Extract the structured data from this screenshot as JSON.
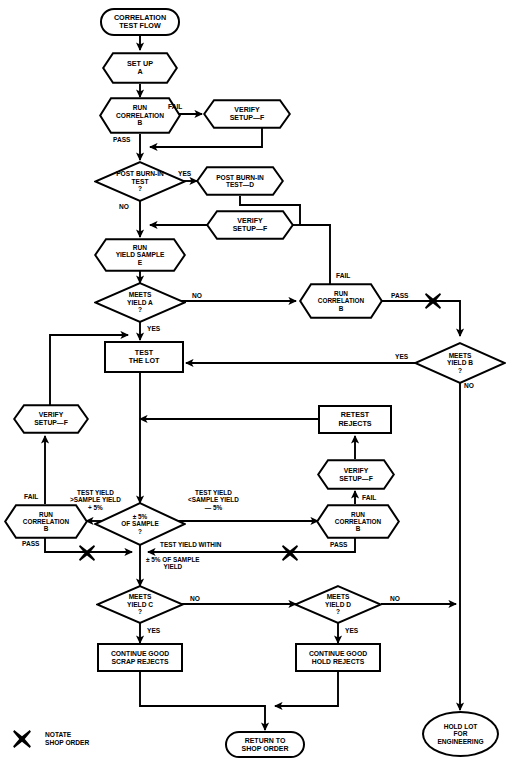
{
  "diagram": {
    "title": "CORRELATION TEST FLOW",
    "type": "flowchart"
  },
  "nodes": {
    "start": {
      "label": "CORRELATION\nTEST FLOW",
      "shape": "stadium"
    },
    "setup_a": {
      "label": "SET UP\nA",
      "shape": "hexagon"
    },
    "run_corr_b_1": {
      "label": "RUN\nCORRELATION\nB",
      "shape": "hexagon"
    },
    "verify_setup_f_1": {
      "label": "VERIFY\nSETUP—F",
      "shape": "hexagon"
    },
    "post_burn_in_test": {
      "label": "POST BURN-IN\nTEST\n?",
      "shape": "diamond"
    },
    "post_burn_in_test_d": {
      "label": "POST BURN-IN\nTEST—D",
      "shape": "hexagon"
    },
    "verify_setup_f_2": {
      "label": "VERIFY\nSETUP—F",
      "shape": "hexagon"
    },
    "run_yield_sample_e": {
      "label": "RUN\nYIELD SAMPLE\nE",
      "shape": "hexagon"
    },
    "meets_yield_a": {
      "label": "MEETS\nYIELD A\n?",
      "shape": "diamond"
    },
    "run_corr_b_2": {
      "label": "RUN\nCORRELATION\nB",
      "shape": "hexagon"
    },
    "meets_yield_b": {
      "label": "MEETS\nYIELD B\n?",
      "shape": "diamond"
    },
    "test_the_lot": {
      "label": "TEST\nTHE LOT",
      "shape": "box"
    },
    "retest_rejects": {
      "label": "RETEST\nREJECTS",
      "shape": "box"
    },
    "verify_setup_f_3": {
      "label": "VERIFY\nSETUP—F",
      "shape": "hexagon"
    },
    "verify_setup_f_4": {
      "label": "VERIFY\nSETUP—F",
      "shape": "hexagon"
    },
    "run_corr_b_3": {
      "label": "RUN\nCORRELATION\nB",
      "shape": "hexagon"
    },
    "run_corr_b_4": {
      "label": "RUN\nCORRELATION\nB",
      "shape": "hexagon"
    },
    "pct5_of_sample": {
      "label": "± 5%\nOF SAMPLE\n?",
      "shape": "diamond"
    },
    "meets_yield_c": {
      "label": "MEETS\nYIELD C\n?",
      "shape": "diamond"
    },
    "meets_yield_d": {
      "label": "MEETS\nYIELD D\n?",
      "shape": "diamond"
    },
    "continue_good_scrap": {
      "label": "CONTINUE GOOD\nSCRAP REJECTS",
      "shape": "box"
    },
    "continue_good_hold": {
      "label": "CONTINUE GOOD\nHOLD REJECTS",
      "shape": "box"
    },
    "return_to_shop_order": {
      "label": "RETURN TO\nSHOP ORDER",
      "shape": "stadium"
    },
    "hold_lot_engineering": {
      "label": "HOLD LOT\nFOR\nENGINEERING",
      "shape": "oval"
    }
  },
  "edge_labels": {
    "fail_1": "FAIL",
    "pass_1": "PASS",
    "yes_burn_in": "YES",
    "no_burn_in": "NO",
    "no_yield_a": "NO",
    "yes_yield_a": "YES",
    "fail_2": "FAIL",
    "pass_2": "PASS",
    "yes_yield_b": "YES",
    "no_yield_b": "NO",
    "fail_left": "FAIL",
    "pass_left": "PASS",
    "fail_right": "FAIL",
    "pass_right": "PASS",
    "test_yield_high": "TEST YIELD\n>SAMPLE YIELD\n+ 5%",
    "test_yield_low": "TEST YIELD\n<SAMPLE YIELD\n— 5%",
    "test_yield_within": "TEST YIELD WITHIN",
    "test_yield_within2": "± 5% OF SAMPLE\nYIELD",
    "no_yield_c": "NO",
    "yes_yield_c": "YES",
    "no_yield_d": "NO",
    "yes_yield_d": "YES"
  },
  "legend": {
    "symbol": "x-mark-icon",
    "text": "NOTATE\nSHOP ORDER"
  },
  "colors": {
    "stroke": "#000000",
    "background": "#ffffff"
  }
}
